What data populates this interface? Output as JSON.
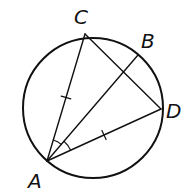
{
  "diagram": {
    "type": "inscribed-circle-geometry",
    "circle": {
      "cx": 93,
      "cy": 108,
      "r": 70
    },
    "points": {
      "A": {
        "label": "A",
        "x": 47,
        "y": 161,
        "lx": 28,
        "ly": 188
      },
      "B": {
        "label": "B",
        "x": 138,
        "y": 55,
        "lx": 141,
        "ly": 48
      },
      "C": {
        "label": "C",
        "x": 85,
        "y": 34,
        "lx": 74,
        "ly": 24
      },
      "D": {
        "label": "D",
        "x": 161,
        "y": 109,
        "lx": 166,
        "ly": 118
      }
    },
    "segments": [
      {
        "from": "A",
        "to": "C",
        "tick": true
      },
      {
        "from": "A",
        "to": "B",
        "tick": false
      },
      {
        "from": "A",
        "to": "D",
        "tick": true
      },
      {
        "from": "C",
        "to": "D",
        "tick": false
      }
    ],
    "angle_marks": [
      {
        "vertex": "A",
        "between": [
          "C",
          "B"
        ],
        "radius": 22
      },
      {
        "vertex": "A",
        "between": [
          "B",
          "D"
        ],
        "radius": 26
      }
    ],
    "stroke_color": "#111111"
  }
}
